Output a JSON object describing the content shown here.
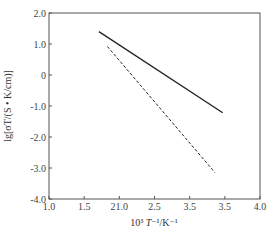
{
  "chart_data": {
    "type": "line",
    "title": "",
    "xlabel": "10³ T⁻¹/K⁻¹",
    "ylabel": "lg[σT/(S·K/cm)]",
    "xlim": [
      1.0,
      4.0
    ],
    "ylim": [
      -4.0,
      2.0
    ],
    "x_ticks": [
      1.0,
      1.5,
      2.0,
      2.5,
      3.0,
      3.5,
      4.0
    ],
    "x_tick_labels": [
      "1.0",
      "1.5",
      "21.0",
      "2.5",
      "3.5",
      "3.5",
      "4.0"
    ],
    "y_ticks": [
      2.0,
      1.0,
      0,
      -1.0,
      -2.0,
      -3.0,
      -4.0
    ],
    "y_tick_labels": [
      "2.0",
      "1.0",
      "0",
      "-1.0",
      "-2.0",
      "-3.0",
      "-4.0"
    ],
    "grid": false,
    "legend": null,
    "series": [
      {
        "name": "solid line",
        "style": "solid",
        "x": [
          1.71,
          3.47
        ],
        "y": [
          1.4,
          -1.22
        ]
      },
      {
        "name": "dashed line",
        "style": "dashed",
        "x": [
          1.83,
          3.36
        ],
        "y": [
          0.92,
          -3.15
        ]
      }
    ]
  },
  "labels": {
    "xlabel_prefix": "10³ ",
    "xlabel_T": "T",
    "xlabel_suffix": "⁻¹/K⁻¹",
    "ylabel": "lg[σT/(S • K/cm)]"
  }
}
